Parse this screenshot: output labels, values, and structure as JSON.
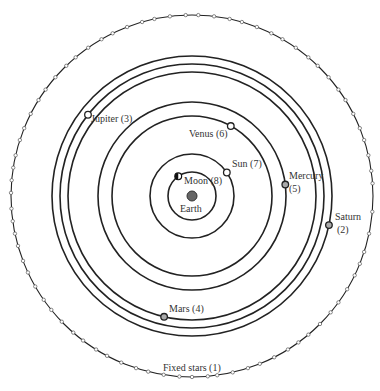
{
  "diagram": {
    "center": {
      "x": 192,
      "y": 196
    },
    "colors": {
      "line": "#222222",
      "earth": "#666666",
      "planet_fill": "#aaaaaa",
      "star_fill": "#ffffff"
    },
    "earth": {
      "label": "Earth",
      "radius": 5
    },
    "orbits": [
      {
        "name": "Moon",
        "number": 8,
        "label": "Moon (8)",
        "radius": 24,
        "angle": 235,
        "body": "moon"
      },
      {
        "name": "Sun",
        "number": 7,
        "label": "Sun (7)",
        "radius": 42,
        "angle": 326,
        "body": "hollow"
      },
      {
        "name": "Venus",
        "number": 6,
        "label": "Venus (6)",
        "radius": 80,
        "angle": 299,
        "body": "hollow"
      },
      {
        "name": "Mercury",
        "number": 5,
        "label": "Mercury (5)",
        "radius": 94,
        "angle": 353,
        "body": "filled"
      },
      {
        "name": "Mars",
        "number": 4,
        "label": "Mars (4)",
        "radius": 124,
        "angle": 103,
        "body": "filled"
      },
      {
        "name": "Jupiter",
        "number": 3,
        "label": "Jupiter (3)",
        "radius": 132,
        "angle": 218,
        "body": "hollow"
      },
      {
        "name": "Saturn",
        "number": 2,
        "label": "Saturn (2)",
        "radius": 140,
        "angle": 12,
        "body": "filled"
      }
    ],
    "fixed_stars": {
      "label": "Fixed stars (1)",
      "radius": 181,
      "star_angles": [
        5,
        12,
        18,
        22,
        26,
        31,
        36,
        40,
        45,
        50,
        54,
        58,
        63,
        68,
        72,
        77,
        82,
        85,
        90,
        94,
        99,
        104,
        108,
        113,
        118,
        122,
        127,
        131,
        136,
        141,
        145,
        150,
        155,
        159,
        164,
        168,
        172,
        176,
        181,
        185,
        189,
        193,
        198,
        202,
        207,
        212,
        216,
        221,
        226,
        230,
        235,
        240,
        244,
        249,
        254,
        258,
        263,
        268,
        272,
        277,
        282,
        286,
        291,
        296,
        300,
        305,
        310,
        314,
        319,
        324,
        328,
        333,
        338,
        342,
        347,
        352,
        356
      ]
    }
  },
  "labels": {
    "earth": "Earth",
    "moon": "Moon (8)",
    "sun": "Sun (7)",
    "venus": "Venus (6)",
    "mercury_1": "Mercury",
    "mercury_2": "(5)",
    "mars": "Mars (4)",
    "jupiter": "Jupiter (3)",
    "saturn_1": "Saturn",
    "saturn_2": "(2)",
    "fixed_stars": "Fixed stars (1)"
  }
}
